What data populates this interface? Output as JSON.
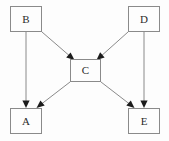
{
  "diagram": {
    "type": "directed-graph",
    "canvas": {
      "width": 169,
      "height": 141,
      "background": "#fdfdfd"
    },
    "style": {
      "node_border_color": "#8a8a8a",
      "node_fill_color": "#fdfdfd",
      "edge_color": "#8a8a8a",
      "arrow_color": "#1c1c1c",
      "label_color": "#2b2b2b"
    },
    "nodes": [
      {
        "id": "B",
        "label": "B",
        "x": 10,
        "y": 6,
        "width": 32,
        "height": 26
      },
      {
        "id": "D",
        "label": "D",
        "x": 128,
        "y": 6,
        "width": 32,
        "height": 26
      },
      {
        "id": "C",
        "label": "C",
        "x": 70,
        "y": 59,
        "width": 31,
        "height": 23
      },
      {
        "id": "A",
        "label": "A",
        "x": 10,
        "y": 108,
        "width": 32,
        "height": 26
      },
      {
        "id": "E",
        "label": "E",
        "x": 128,
        "y": 108,
        "width": 32,
        "height": 26
      }
    ],
    "edges": [
      {
        "id": "B-C",
        "from": "B",
        "to": "C",
        "kind": "diagonal",
        "direction": "down-right"
      },
      {
        "id": "D-C",
        "from": "D",
        "to": "C",
        "kind": "diagonal",
        "direction": "down-left"
      },
      {
        "id": "C-A",
        "from": "C",
        "to": "A",
        "kind": "diagonal",
        "direction": "down-left"
      },
      {
        "id": "C-E",
        "from": "C",
        "to": "E",
        "kind": "diagonal",
        "direction": "down-right"
      },
      {
        "id": "B-A",
        "from": "B",
        "to": "A",
        "kind": "vertical",
        "direction": "down"
      },
      {
        "id": "D-E",
        "from": "D",
        "to": "E",
        "kind": "vertical",
        "direction": "down"
      }
    ]
  }
}
